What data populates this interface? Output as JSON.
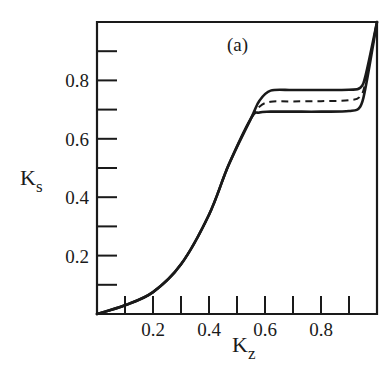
{
  "chart_data": {
    "type": "line",
    "title": "",
    "panel_label": "(a)",
    "xlabel": "K",
    "xlabel_sub": "z",
    "ylabel": "K",
    "ylabel_sub": "s",
    "xlim": [
      0,
      1.0
    ],
    "ylim": [
      0,
      1.0
    ],
    "grid": false,
    "legend": null,
    "x_ticks": [
      0.1,
      0.2,
      0.3,
      0.4,
      0.5,
      0.6,
      0.7,
      0.8,
      0.9
    ],
    "x_tick_labels": [
      {
        "value": 0.2,
        "label": "0.2"
      },
      {
        "value": 0.4,
        "label": "0.4"
      },
      {
        "value": 0.6,
        "label": "0.6"
      },
      {
        "value": 0.8,
        "label": "0.8"
      }
    ],
    "y_ticks": [
      0.1,
      0.2,
      0.3,
      0.4,
      0.5,
      0.6,
      0.7,
      0.8,
      0.9
    ],
    "y_tick_labels": [
      {
        "value": 0.2,
        "label": "0.2"
      },
      {
        "value": 0.4,
        "label": "0.4"
      },
      {
        "value": 0.6,
        "label": "0.6"
      },
      {
        "value": 0.8,
        "label": "0.8"
      }
    ],
    "series": [
      {
        "name": "upper",
        "style": "solid",
        "x": [
          0.0,
          0.1,
          0.2,
          0.3,
          0.4,
          0.47,
          0.55,
          0.58,
          0.62,
          0.7,
          0.8,
          0.9,
          0.94,
          0.96,
          1.0
        ],
        "y": [
          0.0,
          0.03,
          0.075,
          0.17,
          0.34,
          0.51,
          0.67,
          0.73,
          0.765,
          0.767,
          0.767,
          0.768,
          0.775,
          0.82,
          1.0
        ]
      },
      {
        "name": "middle",
        "style": "dashed",
        "x": [
          0.0,
          0.1,
          0.2,
          0.3,
          0.4,
          0.47,
          0.55,
          0.58,
          0.62,
          0.7,
          0.8,
          0.9,
          0.94,
          0.96,
          1.0
        ],
        "y": [
          0.0,
          0.03,
          0.075,
          0.17,
          0.34,
          0.51,
          0.67,
          0.71,
          0.727,
          0.728,
          0.729,
          0.732,
          0.745,
          0.8,
          1.0
        ]
      },
      {
        "name": "lower",
        "style": "solid",
        "x": [
          0.0,
          0.1,
          0.2,
          0.3,
          0.4,
          0.47,
          0.55,
          0.58,
          0.62,
          0.7,
          0.8,
          0.9,
          0.94,
          0.96,
          1.0
        ],
        "y": [
          0.0,
          0.03,
          0.075,
          0.17,
          0.34,
          0.51,
          0.67,
          0.69,
          0.693,
          0.693,
          0.693,
          0.695,
          0.71,
          0.78,
          1.0
        ]
      }
    ]
  }
}
